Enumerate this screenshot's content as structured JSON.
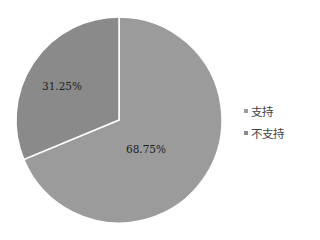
{
  "chart_data": {
    "type": "pie",
    "title": "",
    "categories": [
      "支持",
      "不支持"
    ],
    "values": [
      68.75,
      31.25
    ],
    "labels": [
      "68.75%",
      "31.25%"
    ],
    "colors": [
      "#9b9b9b",
      "#8a8a8a"
    ],
    "legend_position": "right",
    "start_angle": "12 o'clock, clockwise"
  },
  "legend": {
    "items": [
      {
        "label": "支持",
        "color": "#9b9b9b"
      },
      {
        "label": "不支持",
        "color": "#8a8a8a"
      }
    ]
  }
}
